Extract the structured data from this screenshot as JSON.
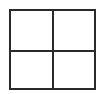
{
  "icon": {
    "name": "grid-2x2-icon",
    "rows": 2,
    "columns": 2,
    "stroke_color": "#2a2a2a",
    "background_color": "#ffffff"
  }
}
